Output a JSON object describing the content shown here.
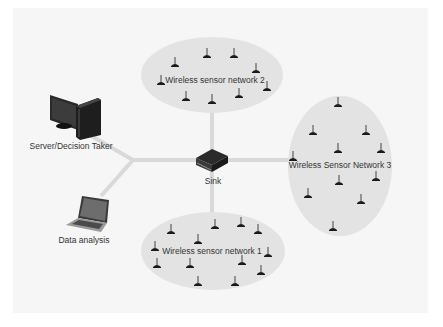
{
  "diagram": {
    "type": "wireless sensor network architecture",
    "colors": {
      "background": "#ffffff",
      "panel": "#f6f6f6",
      "cluster_fill": "#e3e3e3",
      "link": "#d9d9d9",
      "sensor": "#1a1a1a",
      "text": "#333333"
    },
    "nodes": {
      "server": {
        "label": "Server/Decision Taker",
        "icon": "desktop-computer-icon"
      },
      "laptop": {
        "label": "Data analysis",
        "icon": "laptop-icon"
      },
      "sink": {
        "label": "Sink",
        "icon": "sink-box-icon"
      }
    },
    "clusters": [
      {
        "id": "wsn2",
        "label": "Wireless sensor network 2",
        "sensor_count": 10
      },
      {
        "id": "wsn3",
        "label": "Wireless Sensor Network 3",
        "sensor_count": 11
      },
      {
        "id": "wsn1",
        "label": "Wireless sensor network 1",
        "sensor_count": 14
      }
    ],
    "edges": [
      {
        "from": "server",
        "to": "junction"
      },
      {
        "from": "laptop",
        "to": "junction"
      },
      {
        "from": "junction",
        "to": "sink"
      },
      {
        "from": "sink",
        "to": "wsn2"
      },
      {
        "from": "sink",
        "to": "wsn1"
      },
      {
        "from": "sink",
        "to": "wsn3"
      }
    ]
  }
}
